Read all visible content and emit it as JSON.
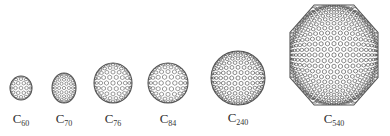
{
  "figure": {
    "molecules": [
      {
        "formula_base": "C",
        "subscript": "60",
        "cx": 21,
        "cy": 88,
        "rx": 11,
        "ry": 12,
        "label_x": 21,
        "label_y": 112,
        "mesh": 4
      },
      {
        "formula_base": "C",
        "subscript": "70",
        "cx": 64,
        "cy": 88,
        "rx": 12,
        "ry": 15,
        "label_x": 64,
        "label_y": 112,
        "mesh": 5
      },
      {
        "formula_base": "C",
        "subscript": "76",
        "cx": 113,
        "cy": 83,
        "rx": 19,
        "ry": 20,
        "label_x": 113,
        "label_y": 112,
        "mesh": 6
      },
      {
        "formula_base": "C",
        "subscript": "84",
        "cx": 168,
        "cy": 83,
        "rx": 20,
        "ry": 20,
        "label_x": 168,
        "label_y": 112,
        "mesh": 6
      },
      {
        "formula_base": "C",
        "subscript": "240",
        "cx": 238,
        "cy": 78,
        "rx": 27,
        "ry": 27,
        "label_x": 238,
        "label_y": 111,
        "mesh": 9
      },
      {
        "formula_base": "C",
        "subscript": "540",
        "cx": 334,
        "cy": 55,
        "rx": 44,
        "ry": 50,
        "label_x": 334,
        "label_y": 112,
        "mesh": 14
      }
    ],
    "line_color": "#555555"
  }
}
